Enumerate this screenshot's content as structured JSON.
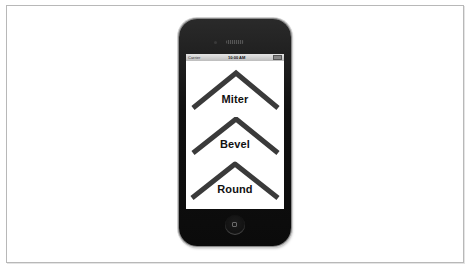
{
  "device": {
    "type": "iPhone 4",
    "status_bar": {
      "carrier": "Carrier",
      "time": "10:00 AM"
    }
  },
  "screen": {
    "background": "#ffffff",
    "stroke_color": "#3a3a3a",
    "items": [
      {
        "label": "Miter",
        "line_join": "miter"
      },
      {
        "label": "Bevel",
        "line_join": "bevel"
      },
      {
        "label": "Round",
        "line_join": "round"
      }
    ]
  },
  "colors": {
    "phone_body": "#111111",
    "frame_border": "#b8b8b8"
  }
}
